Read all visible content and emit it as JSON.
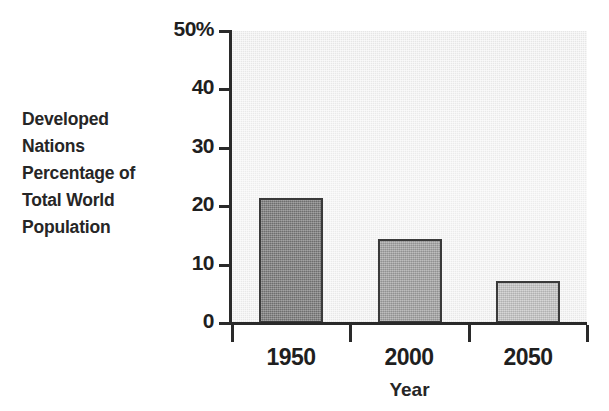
{
  "figure": {
    "y_axis_caption_lines": [
      "Developed",
      "Nations",
      "Percentage of",
      "Total World",
      "Population"
    ],
    "x_axis_title": "Year",
    "plot_background_color": "#e9e9e9",
    "axis_color": "#2a2a2a"
  },
  "chart_data": {
    "type": "bar",
    "title": "",
    "subtitle": "",
    "xlabel": "Year",
    "ylabel": "Developed Nations Percentage of Total World Population",
    "categories": [
      "1950",
      "2000",
      "2050"
    ],
    "values": [
      21.4,
      14.3,
      7.2
    ],
    "value_unit": "%",
    "ylim": [
      0,
      50
    ],
    "ytick_values": [
      0,
      10,
      20,
      30,
      40,
      50
    ],
    "ytick_labels": [
      "0",
      "10",
      "20",
      "30",
      "40",
      "50%"
    ],
    "grid": false,
    "legend": false,
    "legend_position": "none",
    "bar_colors": [
      "#7b7b7b",
      "#a2a2a2",
      "#c6c6c6"
    ],
    "bar_edge_color": "#3a3a3a",
    "annotations": []
  }
}
